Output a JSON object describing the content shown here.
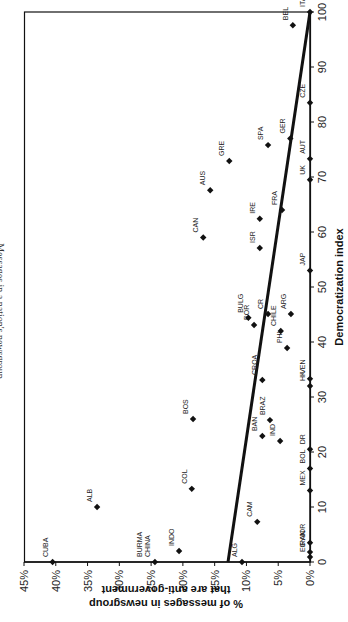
{
  "chart_data": {
    "type": "scatter",
    "orientation": "rotated-90-ccw",
    "title": "Messages in a nation's newsgroup",
    "xlabel": "Democratization index",
    "ylabel_line1": "% of messages in newsgroup",
    "ylabel_line2": "that are anti-government",
    "xlim": [
      0,
      100
    ],
    "ylim": [
      0,
      45
    ],
    "xticks": [
      0,
      10,
      20,
      30,
      40,
      50,
      60,
      70,
      80,
      90,
      100
    ],
    "xtick_labels": [
      "0",
      "10",
      "20",
      "30",
      "40",
      "50",
      "60",
      "70",
      "80",
      "90",
      "100"
    ],
    "yticks": [
      0,
      5,
      10,
      15,
      20,
      25,
      30,
      35,
      40,
      45
    ],
    "ytick_labels": [
      "0%",
      "5%",
      "10%",
      "15%",
      "20%",
      "25%",
      "30%",
      "35%",
      "40%",
      "45%"
    ],
    "grid": false,
    "legend": "none",
    "points": [
      {
        "label": "CUBA",
        "x": 0,
        "y": 40.5
      },
      {
        "label": "CHINA",
        "x": 0,
        "y": 24.4
      },
      {
        "label": "BURMA",
        "x": 0,
        "y": 24.4
      },
      {
        "label": "INDO",
        "x": 2,
        "y": 20.6
      },
      {
        "label": "ALG",
        "x": 0,
        "y": 10.7
      },
      {
        "label": "EGY",
        "x": 0.9,
        "y": 0
      },
      {
        "label": "IRAN",
        "x": 1.8,
        "y": 0
      },
      {
        "label": "JOR",
        "x": 3.5,
        "y": 0
      },
      {
        "label": "ALB",
        "x": 10,
        "y": 33.5
      },
      {
        "label": "CAM",
        "x": 7.3,
        "y": 8.3
      },
      {
        "label": "COL",
        "x": 13.3,
        "y": 18.6
      },
      {
        "label": "MEX",
        "x": 13,
        "y": 0
      },
      {
        "label": "BOL",
        "x": 17,
        "y": 0
      },
      {
        "label": "DR",
        "x": 20.5,
        "y": 0
      },
      {
        "label": "IND",
        "x": 22,
        "y": 4.7
      },
      {
        "label": "BAN",
        "x": 22.9,
        "y": 7.5
      },
      {
        "label": "BRAZ",
        "x": 25.8,
        "y": 6.3
      },
      {
        "label": "BOS",
        "x": 26,
        "y": 18.4
      },
      {
        "label": "HK",
        "x": 32,
        "y": 0
      },
      {
        "label": "VEN",
        "x": 33.3,
        "y": 0
      },
      {
        "label": "CROA",
        "x": 33.1,
        "y": 7.5
      },
      {
        "label": "PHI",
        "x": 38.9,
        "y": 3.6
      },
      {
        "label": "CHILE",
        "x": 42,
        "y": 4.6
      },
      {
        "label": "POR",
        "x": 43.1,
        "y": 8.8
      },
      {
        "label": "BULG",
        "x": 44.4,
        "y": 9.7
      },
      {
        "label": "CR",
        "x": 45.1,
        "y": 6.6
      },
      {
        "label": "ARG",
        "x": 45.1,
        "y": 3.0
      },
      {
        "label": "JAP",
        "x": 53,
        "y": 0
      },
      {
        "label": "ISR",
        "x": 57.1,
        "y": 7.9
      },
      {
        "label": "CAN",
        "x": 59,
        "y": 16.8
      },
      {
        "label": "IRE",
        "x": 62.4,
        "y": 7.9
      },
      {
        "label": "FRA",
        "x": 64,
        "y": 4.4
      },
      {
        "label": "AUS",
        "x": 67.6,
        "y": 15.7
      },
      {
        "label": "UK",
        "x": 69.5,
        "y": 0
      },
      {
        "label": "GRE",
        "x": 72.9,
        "y": 12.7
      },
      {
        "label": "AUT",
        "x": 73.3,
        "y": 0
      },
      {
        "label": "SPA",
        "x": 75.8,
        "y": 6.6
      },
      {
        "label": "GER",
        "x": 77,
        "y": 3.1
      },
      {
        "label": "CZE",
        "x": 83.5,
        "y": 0
      },
      {
        "label": "BEL",
        "x": 97.6,
        "y": 2.7
      },
      {
        "label": "ITA",
        "x": 100,
        "y": 0
      }
    ],
    "trendline": {
      "x": [
        0,
        100
      ],
      "y": [
        12.9,
        0
      ]
    }
  }
}
